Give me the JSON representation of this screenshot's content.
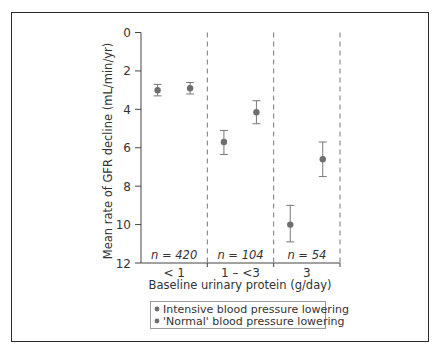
{
  "chart_data": {
    "type": "scatter",
    "title": "",
    "xlabel": "Baseline urinary protein (g/day)",
    "ylabel": "Mean rate of GFR decline (mL/min/yr)",
    "ylim": [
      0,
      12
    ],
    "y_inverted": true,
    "yticks": [
      0,
      2,
      4,
      6,
      8,
      10,
      12
    ],
    "grid": false,
    "categories": [
      "< 1",
      "1 – <3",
      "3"
    ],
    "group_n": [
      "n = 420",
      "n = 104",
      "n = 54"
    ],
    "series": [
      {
        "name": "Intensive blood pressure lowering",
        "color": "#6e6e6e",
        "values": [
          3.0,
          5.7,
          10.0
        ],
        "error_low": [
          2.7,
          5.1,
          9.0
        ],
        "error_high": [
          3.3,
          6.35,
          10.9
        ]
      },
      {
        "name": "'Normal' blood pressure lowering",
        "color": "#6e6e6e",
        "values": [
          2.9,
          4.15,
          6.6
        ],
        "error_low": [
          2.6,
          3.55,
          5.7
        ],
        "error_high": [
          3.2,
          4.75,
          7.5
        ]
      }
    ],
    "legend_position": "bottom",
    "group_separators": "dashed vertical lines"
  },
  "legend": {
    "items": [
      "Intensive blood pressure lowering",
      "'Normal' blood pressure lowering"
    ]
  }
}
